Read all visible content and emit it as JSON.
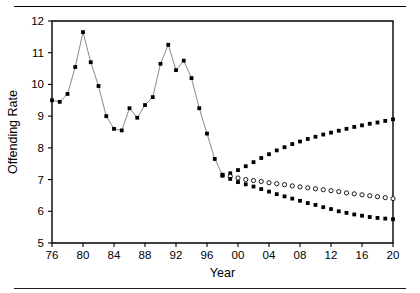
{
  "chart_data": {
    "type": "line",
    "title": "",
    "xlabel": "Year",
    "ylabel": "Offending Rate",
    "xlim": [
      1976,
      2020
    ],
    "ylim": [
      5,
      12
    ],
    "grid": false,
    "legend": "none",
    "x_tick_labels": [
      "76",
      "80",
      "84",
      "88",
      "92",
      "96",
      "00",
      "04",
      "08",
      "12",
      "16",
      "20"
    ],
    "x_tick_values": [
      1976,
      1980,
      1984,
      1988,
      1992,
      1996,
      2000,
      2004,
      2008,
      2012,
      2016,
      2020
    ],
    "y_tick_labels": [
      "5",
      "6",
      "7",
      "8",
      "9",
      "10",
      "11",
      "12"
    ],
    "y_tick_values": [
      5,
      6,
      7,
      8,
      9,
      10,
      11,
      12
    ],
    "series": [
      {
        "name": "Observed offending rate",
        "marker": "filled-square",
        "line": true,
        "x": [
          1976,
          1977,
          1978,
          1979,
          1980,
          1981,
          1982,
          1983,
          1984,
          1985,
          1986,
          1987,
          1988,
          1989,
          1990,
          1991,
          1992,
          1993,
          1994,
          1995,
          1996,
          1997,
          1998
        ],
        "values": [
          9.5,
          9.45,
          9.7,
          10.55,
          11.65,
          10.7,
          9.95,
          9.0,
          8.6,
          8.55,
          9.25,
          8.95,
          9.35,
          9.6,
          10.65,
          11.25,
          10.45,
          10.75,
          10.2,
          9.25,
          8.45,
          7.65,
          7.15
        ]
      },
      {
        "name": "Upper projection",
        "marker": "filled-square",
        "line": false,
        "x": [
          1998,
          1999,
          2000,
          2001,
          2002,
          2003,
          2004,
          2005,
          2006,
          2007,
          2008,
          2009,
          2010,
          2011,
          2012,
          2013,
          2014,
          2015,
          2016,
          2017,
          2018,
          2019,
          2020
        ],
        "values": [
          7.15,
          7.2,
          7.3,
          7.42,
          7.55,
          7.68,
          7.8,
          7.92,
          8.02,
          8.12,
          8.2,
          8.28,
          8.35,
          8.42,
          8.48,
          8.54,
          8.6,
          8.66,
          8.71,
          8.76,
          8.8,
          8.85,
          8.9
        ]
      },
      {
        "name": "Central projection",
        "marker": "open-circle",
        "line": false,
        "x": [
          1999,
          2000,
          2001,
          2002,
          2003,
          2004,
          2005,
          2006,
          2007,
          2008,
          2009,
          2010,
          2011,
          2012,
          2013,
          2014,
          2015,
          2016,
          2017,
          2018,
          2019,
          2020
        ],
        "values": [
          7.1,
          7.05,
          7.0,
          6.97,
          6.94,
          6.9,
          6.87,
          6.84,
          6.8,
          6.77,
          6.74,
          6.71,
          6.68,
          6.65,
          6.62,
          6.58,
          6.55,
          6.52,
          6.49,
          6.46,
          6.43,
          6.4
        ]
      },
      {
        "name": "Lower projection",
        "marker": "filled-square",
        "line": false,
        "x": [
          1998,
          1999,
          2000,
          2001,
          2002,
          2003,
          2004,
          2005,
          2006,
          2007,
          2008,
          2009,
          2010,
          2011,
          2012,
          2013,
          2014,
          2015,
          2016,
          2017,
          2018,
          2019,
          2020
        ],
        "values": [
          7.12,
          7.02,
          6.92,
          6.85,
          6.78,
          6.7,
          6.62,
          6.54,
          6.47,
          6.4,
          6.33,
          6.26,
          6.2,
          6.13,
          6.07,
          6.0,
          5.95,
          5.9,
          5.86,
          5.82,
          5.79,
          5.77,
          5.75
        ]
      }
    ]
  },
  "figure": {
    "rule_top": "",
    "rule_bottom": ""
  }
}
